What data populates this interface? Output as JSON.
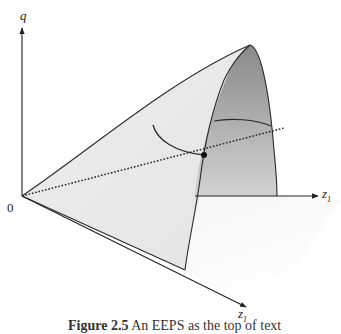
{
  "figure": {
    "axes": {
      "vertical_label": "q",
      "origin_label": "0",
      "right_axis": {
        "base": "z",
        "sub": "1"
      },
      "front_axis": {
        "base": "z",
        "sub": "1"
      }
    },
    "caption": {
      "label": "Figure 2.5",
      "text": "An EEPS as the top of text"
    },
    "colors": {
      "surface_light": "#ececee",
      "surface_dark": "#8f8f8f",
      "line": "#2a2a2a"
    }
  }
}
